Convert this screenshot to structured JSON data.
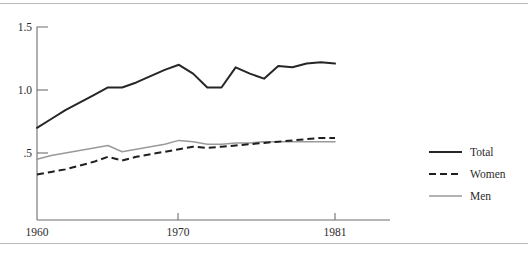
{
  "chart_data": {
    "type": "line",
    "title": "",
    "subtitle": "",
    "xlabel": "",
    "ylabel": "",
    "xlim": [
      1960,
      1981
    ],
    "ylim": [
      0.25,
      1.5
    ],
    "grid": false,
    "legend_position": "right",
    "x_ticks": [
      "1960",
      "1970",
      "1981"
    ],
    "x_tick_values": [
      1960,
      1970,
      1981
    ],
    "y_ticks": [
      ".5",
      "1.0",
      "1.5"
    ],
    "y_tick_values": [
      0.5,
      1.0,
      1.5
    ],
    "x": [
      1960,
      1961,
      1962,
      1963,
      1964,
      1965,
      1966,
      1967,
      1968,
      1969,
      1970,
      1971,
      1972,
      1973,
      1974,
      1975,
      1976,
      1977,
      1978,
      1979,
      1980,
      1981
    ],
    "series": [
      {
        "name": "Total",
        "color": "#262626",
        "style": "solid",
        "values": [
          0.7,
          0.77,
          0.84,
          0.9,
          0.96,
          1.02,
          1.02,
          1.06,
          1.11,
          1.16,
          1.2,
          1.13,
          1.02,
          1.02,
          1.18,
          1.13,
          1.09,
          1.19,
          1.18,
          1.21,
          1.22,
          1.21
        ]
      },
      {
        "name": "Women",
        "color": "#1f1f1f",
        "style": "dashed",
        "values": [
          0.33,
          0.35,
          0.37,
          0.4,
          0.43,
          0.47,
          0.44,
          0.47,
          0.49,
          0.51,
          0.53,
          0.55,
          0.54,
          0.55,
          0.56,
          0.57,
          0.58,
          0.59,
          0.6,
          0.61,
          0.62,
          0.62
        ]
      },
      {
        "name": "Men",
        "color": "#9a9a9a",
        "style": "solid-light",
        "values": [
          0.45,
          0.48,
          0.5,
          0.52,
          0.54,
          0.56,
          0.51,
          0.53,
          0.55,
          0.57,
          0.6,
          0.59,
          0.57,
          0.57,
          0.58,
          0.58,
          0.59,
          0.59,
          0.59,
          0.59,
          0.59,
          0.59
        ]
      }
    ]
  },
  "legend": {
    "items": [
      {
        "label": "Total"
      },
      {
        "label": "Women"
      },
      {
        "label": "Men"
      }
    ]
  }
}
